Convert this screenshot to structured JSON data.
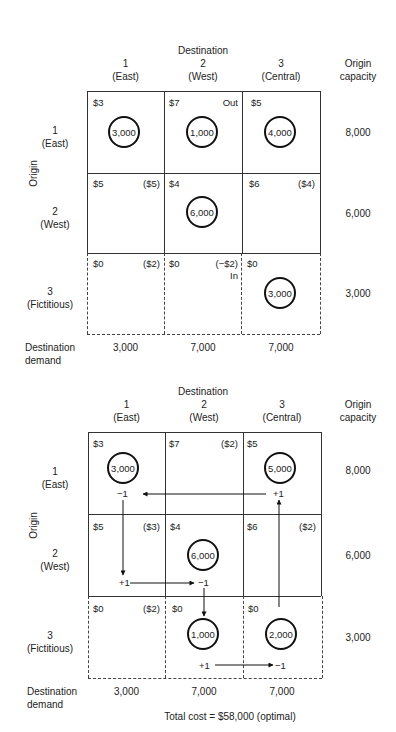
{
  "tables": [
    {
      "destination_title": "Destination",
      "columns": [
        {
          "num": "1",
          "name": "(East)"
        },
        {
          "num": "2",
          "name": "(West)"
        },
        {
          "num": "3",
          "name": "(Central)"
        }
      ],
      "capacity_header": [
        "Origin",
        "capacity"
      ],
      "origin_label": "Origin",
      "rows": [
        {
          "num": "1",
          "name": "(East)",
          "capacity": "8,000",
          "cells": [
            {
              "cost": "$3",
              "note": "",
              "alloc": "3,000"
            },
            {
              "cost": "$7",
              "note": "Out",
              "alloc": "1,000"
            },
            {
              "cost": "$5",
              "note": "",
              "alloc": "4,000"
            }
          ]
        },
        {
          "num": "2",
          "name": "(West)",
          "capacity": "6,000",
          "cells": [
            {
              "cost": "$5",
              "note": "($5)",
              "alloc": ""
            },
            {
              "cost": "$4",
              "note": "",
              "alloc": "6,000"
            },
            {
              "cost": "$6",
              "note": "($4)",
              "alloc": ""
            }
          ]
        },
        {
          "num": "3",
          "name": "(Fictitious)",
          "capacity": "3,000",
          "cells": [
            {
              "cost": "$0",
              "note": "($2)",
              "alloc": ""
            },
            {
              "cost": "$0",
              "note": "(−$2)",
              "note2": "In",
              "alloc": ""
            },
            {
              "cost": "$0",
              "note": "",
              "alloc": "3,000"
            }
          ]
        }
      ],
      "demand_label": [
        "Destination",
        "demand"
      ],
      "demands": [
        "3,000",
        "7,000",
        "7,000"
      ]
    },
    {
      "destination_title": "Destination",
      "columns": [
        {
          "num": "1",
          "name": "(East)"
        },
        {
          "num": "2",
          "name": "(West)"
        },
        {
          "num": "3",
          "name": "(Central)"
        }
      ],
      "capacity_header": [
        "Origin",
        "capacity"
      ],
      "origin_label": "Origin",
      "rows": [
        {
          "num": "1",
          "name": "(East)",
          "capacity": "8,000",
          "cells": [
            {
              "cost": "$3",
              "note": "",
              "alloc": "3,000",
              "mark": "−1"
            },
            {
              "cost": "$7",
              "note": "($2)",
              "alloc": ""
            },
            {
              "cost": "$5",
              "note": "",
              "alloc": "5,000",
              "mark": "+1"
            }
          ]
        },
        {
          "num": "2",
          "name": "(West)",
          "capacity": "6,000",
          "cells": [
            {
              "cost": "$5",
              "note": "($3)",
              "alloc": "",
              "mark": "+1"
            },
            {
              "cost": "$4",
              "note": "",
              "alloc": "6,000",
              "mark": "−1"
            },
            {
              "cost": "$6",
              "note": "($2)",
              "alloc": ""
            }
          ]
        },
        {
          "num": "3",
          "name": "(Fictitious)",
          "capacity": "3,000",
          "cells": [
            {
              "cost": "$0",
              "note": "($2)",
              "alloc": ""
            },
            {
              "cost": "$0",
              "note": "",
              "alloc": "1,000",
              "mark": "+1"
            },
            {
              "cost": "$0",
              "note": "",
              "alloc": "2,000",
              "mark": "−1"
            }
          ]
        }
      ],
      "demand_label": [
        "Destination",
        "demand"
      ],
      "demands": [
        "3,000",
        "7,000",
        "7,000"
      ],
      "total_cost": "Total cost = $58,000 (optimal)"
    }
  ]
}
